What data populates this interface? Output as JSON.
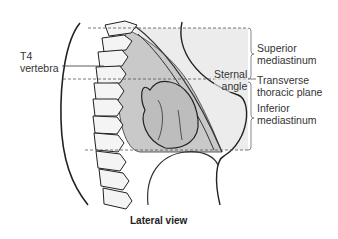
{
  "diagram": {
    "labels": {
      "t4_line1": "T4",
      "t4_line2": "vertebra",
      "sternal_line1": "Sternal",
      "sternal_line2": "angle",
      "superior_line1": "Superior",
      "superior_line2": "mediastinum",
      "transverse_line1": "Transverse",
      "transverse_line2": "thoracic plane",
      "inferior_line1": "Inferior",
      "inferior_line2": "mediastinum"
    },
    "caption": "Lateral view",
    "colors": {
      "mediastinum_fill": "#c8c8c8",
      "background_fill": "#e6e6e6",
      "line": "#222222",
      "dashed": "#555555"
    }
  }
}
